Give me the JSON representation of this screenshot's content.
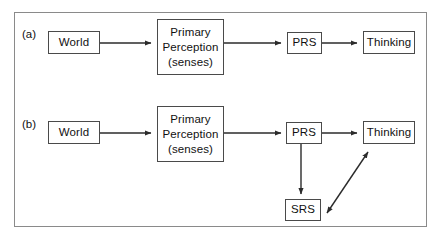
{
  "figure": {
    "caption_labels": {
      "panel_a": "(a)",
      "panel_b": "(b)"
    },
    "colors": {
      "frame_border": "#8a8a8a",
      "box_border": "#4a4a4a",
      "arrow": "#2b2b2b",
      "text": "#111111",
      "background": "#ffffff"
    },
    "panels": [
      {
        "id": "a",
        "label": "(a)",
        "nodes": [
          {
            "id": "world_a",
            "lines": [
              "World"
            ]
          },
          {
            "id": "primary_perception_a",
            "lines": [
              "Primary",
              "Perception",
              "(senses)"
            ]
          },
          {
            "id": "prs_a",
            "lines": [
              "PRS"
            ]
          },
          {
            "id": "thinking_a",
            "lines": [
              "Thinking"
            ]
          }
        ],
        "edges": [
          {
            "from": "world_a",
            "to": "primary_perception_a",
            "style": "single-arrow"
          },
          {
            "from": "primary_perception_a",
            "to": "prs_a",
            "style": "single-arrow"
          },
          {
            "from": "prs_a",
            "to": "thinking_a",
            "style": "single-arrow"
          }
        ]
      },
      {
        "id": "b",
        "label": "(b)",
        "nodes": [
          {
            "id": "world_b",
            "lines": [
              "World"
            ]
          },
          {
            "id": "primary_perception_b",
            "lines": [
              "Primary",
              "Perception",
              "(senses)"
            ]
          },
          {
            "id": "prs_b",
            "lines": [
              "PRS"
            ]
          },
          {
            "id": "thinking_b",
            "lines": [
              "Thinking"
            ]
          },
          {
            "id": "srs_b",
            "lines": [
              "SRS"
            ]
          }
        ],
        "edges": [
          {
            "from": "world_b",
            "to": "primary_perception_b",
            "style": "single-arrow"
          },
          {
            "from": "primary_perception_b",
            "to": "prs_b",
            "style": "single-arrow"
          },
          {
            "from": "prs_b",
            "to": "thinking_b",
            "style": "single-arrow"
          },
          {
            "from": "prs_b",
            "to": "srs_b",
            "style": "single-arrow"
          },
          {
            "from": "srs_b",
            "to": "thinking_b",
            "style": "double-arrow"
          }
        ]
      }
    ]
  }
}
